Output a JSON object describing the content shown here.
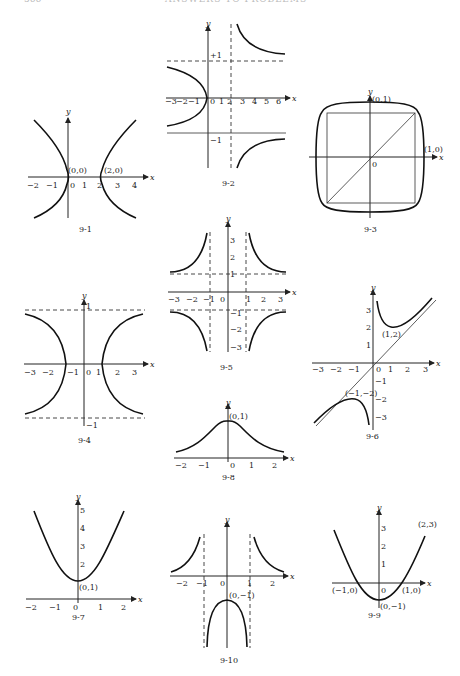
{
  "page": {
    "header_title": "ANSWERS TO PROBLEMS",
    "page_number": "566"
  },
  "figures": {
    "f1": {
      "caption": "9-1",
      "x_axis": "x",
      "y_axis": "y",
      "x_ticks": [
        "−2",
        "−1",
        "0",
        "1",
        "2",
        "3",
        "4"
      ],
      "points": [
        "(0,0)",
        "(2,0)"
      ]
    },
    "f2": {
      "caption": "9-2",
      "x_axis": "x",
      "y_axis": "y",
      "x_ticks": [
        "−3",
        "−2",
        "−1",
        "0",
        "1",
        "2",
        "3",
        "4",
        "5",
        "6"
      ],
      "y_ticks": [
        "+1",
        "−1"
      ]
    },
    "f3": {
      "caption": "9-3",
      "x_axis": "x",
      "y_axis": "y",
      "origin": "0",
      "points": [
        "(0,1)",
        "(1,0)"
      ]
    },
    "f4": {
      "caption": "9-4",
      "x_axis": "x",
      "y_axis": "y",
      "x_ticks": [
        "−3",
        "−2",
        "−1",
        "0",
        "1",
        "2",
        "3"
      ],
      "y_ticks": [
        "1",
        "−1"
      ]
    },
    "f5": {
      "caption": "9-5",
      "x_axis": "x",
      "y_axis": "y",
      "x_ticks": [
        "−3",
        "−2",
        "−1",
        "0",
        "1",
        "2",
        "3"
      ],
      "y_ticks": [
        "3",
        "2",
        "1",
        "−1",
        "−2",
        "−3"
      ]
    },
    "f6": {
      "caption": "9-6",
      "x_axis": "x",
      "y_axis": "y",
      "x_ticks": [
        "−3",
        "−2",
        "−1",
        "0",
        "1",
        "2",
        "3"
      ],
      "y_ticks": [
        "3",
        "2",
        "1",
        "−1",
        "−2",
        "−3"
      ],
      "points": [
        "(1,2)",
        "(−1,−2)"
      ]
    },
    "f7": {
      "caption": "9-7",
      "x_axis": "x",
      "y_axis": "y",
      "x_ticks": [
        "−2",
        "−1",
        "0",
        "1",
        "2"
      ],
      "y_ticks": [
        "5",
        "4",
        "3",
        "2"
      ],
      "points": [
        "(0,1)"
      ]
    },
    "f8": {
      "caption": "9-8",
      "x_axis": "x",
      "y_axis": "y",
      "x_ticks": [
        "−2",
        "−1",
        "0",
        "1",
        "2"
      ],
      "points": [
        "(0,1)"
      ]
    },
    "f9": {
      "caption": "9-9",
      "x_axis": "x",
      "y_axis": "y",
      "x_ticks": [
        "0"
      ],
      "y_ticks": [
        "3",
        "2",
        "1"
      ],
      "points": [
        "(−1,0)",
        "(1,0)",
        "(0,−1)",
        "(2,3)"
      ]
    },
    "f10": {
      "caption": "9-10",
      "x_axis": "x",
      "y_axis": "y",
      "x_ticks": [
        "−2",
        "−1",
        "0",
        "1",
        "2"
      ],
      "points": [
        "(0,−1)"
      ]
    }
  }
}
